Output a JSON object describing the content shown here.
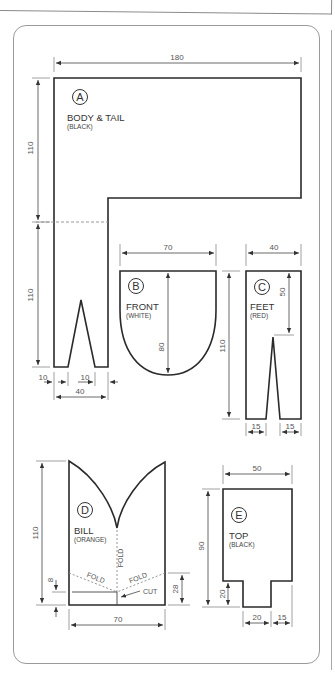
{
  "colors": {
    "outline": "#2a2a2a",
    "dimension": "#555555",
    "panel_border": "#9a9a9a",
    "background": "#ffffff"
  },
  "pattern": {
    "pieces": [
      {
        "id": "A",
        "name": "BODY & TAIL",
        "color_note": "(BLACK)",
        "dimensions": {
          "width": "180",
          "upper_height": "110",
          "lower_height": "110",
          "stem_width": "40",
          "left_margin": "10",
          "notch_width": "10"
        }
      },
      {
        "id": "B",
        "name": "FRONT",
        "color_note": "(WHITE)",
        "dimensions": {
          "width": "70",
          "height": "80"
        }
      },
      {
        "id": "C",
        "name": "FEET",
        "color_note": "(RED)",
        "dimensions": {
          "width": "40",
          "height": "110",
          "notch_depth": "50",
          "foot_left": "15",
          "foot_right": "15"
        }
      },
      {
        "id": "D",
        "name": "BILL",
        "color_note": "(ORANGE)",
        "dimensions": {
          "height": "110",
          "width": "70",
          "side": "28",
          "cut_offset": "8"
        },
        "annotations": {
          "fold_center": "FOLD",
          "fold_left": "FOLD",
          "fold_right": "FOLD",
          "cut": "CUT"
        }
      },
      {
        "id": "E",
        "name": "TOP",
        "color_note": "(BLACK)",
        "dimensions": {
          "width": "50",
          "height": "90",
          "tab_height": "20",
          "tab_width": "20",
          "right_offset": "15"
        }
      }
    ]
  }
}
